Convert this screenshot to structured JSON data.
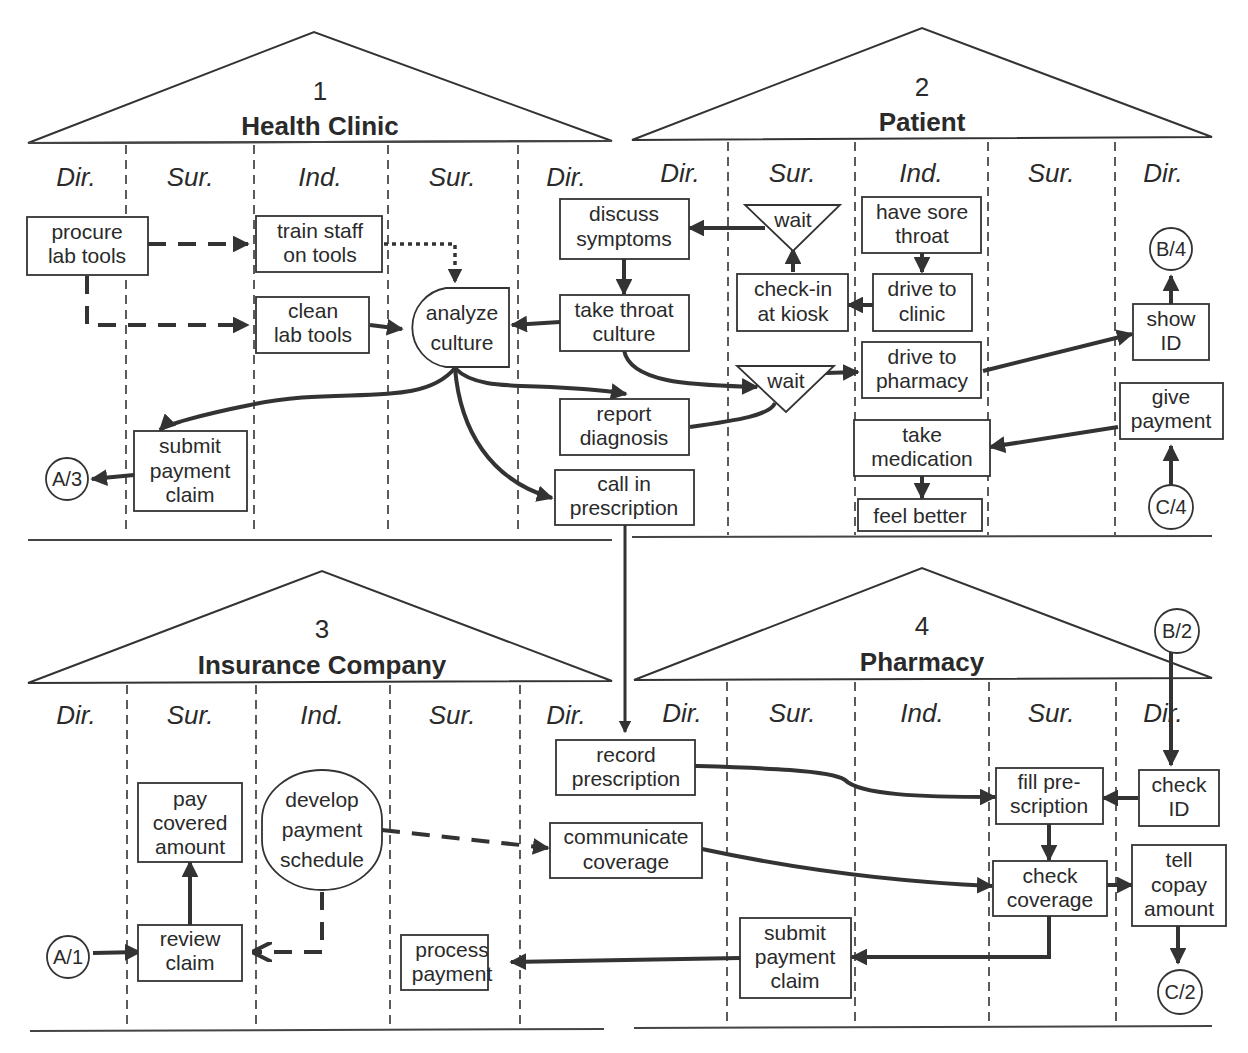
{
  "colors": {
    "line": "#333333",
    "text": "#2a2a2a",
    "background": "#ffffff"
  },
  "column_labels": [
    "Dir.",
    "Sur.",
    "Ind.",
    "Sur.",
    "Dir."
  ],
  "organizations": [
    {
      "number": "1",
      "name": "Health Clinic"
    },
    {
      "number": "2",
      "name": "Patient"
    },
    {
      "number": "3",
      "name": "Insurance Company"
    },
    {
      "number": "4",
      "name": "Pharmacy"
    }
  ],
  "nodes": {
    "procure_lab_tools": [
      "procure",
      "lab tools"
    ],
    "train_staff": [
      "train staff",
      "on tools"
    ],
    "clean_lab_tools": [
      "clean",
      "lab tools"
    ],
    "analyze_culture": [
      "analyze",
      "culture"
    ],
    "submit_payment_claim_clinic": [
      "submit",
      "payment",
      "claim"
    ],
    "discuss_symptoms": [
      "discuss",
      "symptoms"
    ],
    "take_throat_culture": [
      "take throat",
      "culture"
    ],
    "report_diagnosis": [
      "report",
      "diagnosis"
    ],
    "call_in_prescription": [
      "call in",
      "prescription"
    ],
    "wait_1": [
      "wait"
    ],
    "check_in_kiosk": [
      "check-in",
      "at kiosk"
    ],
    "wait_2": [
      "wait"
    ],
    "have_sore_throat": [
      "have sore",
      "throat"
    ],
    "drive_to_clinic": [
      "drive to",
      "clinic"
    ],
    "drive_to_pharmacy": [
      "drive to",
      "pharmacy"
    ],
    "take_medication": [
      "take",
      "medication"
    ],
    "feel_better": [
      "feel better"
    ],
    "show_id": [
      "show",
      "ID"
    ],
    "give_payment": [
      "give",
      "payment"
    ],
    "pay_covered_amount": [
      "pay",
      "covered",
      "amount"
    ],
    "review_claim": [
      "review",
      "claim"
    ],
    "develop_payment_schedule": [
      "develop",
      "payment",
      "schedule"
    ],
    "process_payment": [
      "process",
      "payment"
    ],
    "record_prescription": [
      "record",
      "prescription"
    ],
    "communicate_coverage": [
      "communicate",
      "coverage"
    ],
    "submit_payment_claim_pharmacy": [
      "submit",
      "payment",
      "claim"
    ],
    "fill_prescription": [
      "fill pre-",
      "scription"
    ],
    "check_coverage": [
      "check",
      "coverage"
    ],
    "check_id": [
      "check",
      "ID"
    ],
    "tell_copay_amount": [
      "tell",
      "copay",
      "amount"
    ]
  },
  "connectors": {
    "a3": "A/3",
    "b4": "B/4",
    "c4": "C/4",
    "a1": "A/1",
    "b2": "B/2",
    "c2": "C/2"
  }
}
